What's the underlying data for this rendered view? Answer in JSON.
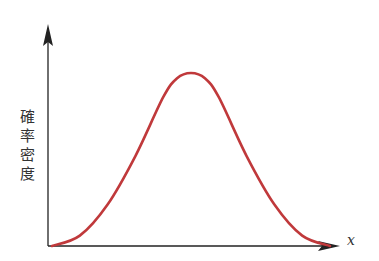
{
  "chart_data": {
    "type": "line",
    "title": "",
    "xlabel": "x",
    "ylabel": "確率密度",
    "ylabel_chars": [
      "確",
      "率",
      "密",
      "度"
    ],
    "axes": {
      "x_ticks": [],
      "y_ticks": [],
      "grid": false,
      "arrows": true
    },
    "series": [
      {
        "name": "density",
        "color": "#c0393b",
        "x": [
          0,
          0.1,
          0.2,
          0.3,
          0.4,
          0.45,
          0.5,
          0.55,
          0.6,
          0.7,
          0.8,
          0.9,
          1.0
        ],
        "values": [
          0.0,
          0.06,
          0.24,
          0.52,
          0.86,
          0.97,
          1.0,
          0.97,
          0.86,
          0.52,
          0.24,
          0.06,
          0.0
        ]
      }
    ]
  },
  "colors": {
    "axis": "#222222",
    "curve": "#c0393b",
    "text": "#333333"
  }
}
